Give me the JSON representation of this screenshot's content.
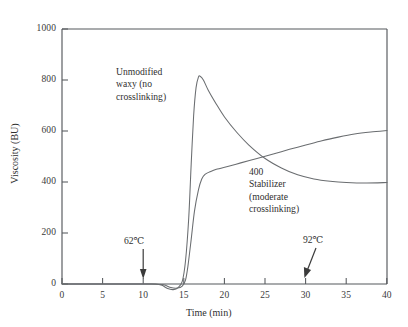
{
  "chart_data": {
    "type": "line",
    "title": "",
    "xlabel": "Time (min)",
    "ylabel": "Viscosity (BU)",
    "xlim": [
      0,
      40
    ],
    "ylim": [
      0,
      1000
    ],
    "xticks": [
      0,
      5,
      10,
      15,
      20,
      25,
      30,
      35,
      40
    ],
    "yticks": [
      0,
      200,
      400,
      600,
      800,
      1000
    ],
    "xtick_labels": [
      "0",
      "5",
      "10",
      "15",
      "20",
      "25",
      "30",
      "35",
      "40"
    ],
    "ytick_labels": [
      "0",
      "200",
      "400",
      "600",
      "800",
      "1000"
    ],
    "grid": false,
    "legend": "inline-annotations",
    "series": [
      {
        "name": "Unmodified waxy (no crosslinking)",
        "label_lines": [
          "Unmodified",
          "waxy (no",
          "crosslinking)"
        ],
        "points": [
          [
            0,
            0
          ],
          [
            2,
            0
          ],
          [
            4,
            0
          ],
          [
            6,
            0
          ],
          [
            8,
            0
          ],
          [
            10,
            0
          ],
          [
            11.5,
            0
          ],
          [
            12.3,
            -5
          ],
          [
            13.0,
            -18
          ],
          [
            13.7,
            -22
          ],
          [
            14.3,
            -14
          ],
          [
            14.8,
            10
          ],
          [
            15.2,
            90
          ],
          [
            15.6,
            260
          ],
          [
            15.9,
            470
          ],
          [
            16.2,
            660
          ],
          [
            16.5,
            770
          ],
          [
            16.8,
            812
          ],
          [
            17.0,
            815
          ],
          [
            17.4,
            800
          ],
          [
            18.0,
            760
          ],
          [
            19.0,
            705
          ],
          [
            20.0,
            655
          ],
          [
            21.5,
            595
          ],
          [
            23.0,
            545
          ],
          [
            25.0,
            492
          ],
          [
            27.0,
            455
          ],
          [
            29.0,
            428
          ],
          [
            31.0,
            412
          ],
          [
            33.0,
            403
          ],
          [
            35.0,
            398
          ],
          [
            37.5,
            396
          ],
          [
            40.0,
            398
          ]
        ]
      },
      {
        "name": "400 Stabilizer (moderate crosslinking)",
        "label_lines": [
          "400",
          "Stabilizer",
          "(moderate",
          "crosslinking)"
        ],
        "points": [
          [
            0,
            0
          ],
          [
            3,
            0
          ],
          [
            6,
            0
          ],
          [
            9,
            0
          ],
          [
            11,
            0
          ],
          [
            12.5,
            -3
          ],
          [
            13.4,
            -14
          ],
          [
            14.2,
            -16
          ],
          [
            14.8,
            -8
          ],
          [
            15.2,
            15
          ],
          [
            15.5,
            70
          ],
          [
            15.9,
            175
          ],
          [
            16.3,
            285
          ],
          [
            16.8,
            370
          ],
          [
            17.2,
            412
          ],
          [
            17.6,
            430
          ],
          [
            18.2,
            440
          ],
          [
            19.0,
            450
          ],
          [
            20.5,
            462
          ],
          [
            22.0,
            475
          ],
          [
            24.0,
            492
          ],
          [
            26.0,
            510
          ],
          [
            28.0,
            528
          ],
          [
            30.0,
            545
          ],
          [
            32.0,
            562
          ],
          [
            34.0,
            576
          ],
          [
            36.0,
            588
          ],
          [
            38.0,
            596
          ],
          [
            40.0,
            602
          ]
        ]
      }
    ],
    "annotations": [
      {
        "text": "62℃",
        "x": 10,
        "y": 0,
        "arrow": "down",
        "name": "temperature-annotation-62c"
      },
      {
        "text": "92℃",
        "x": 30,
        "y": 0,
        "arrow": "down-left",
        "name": "temperature-annotation-92c"
      }
    ],
    "colors": {
      "axis": "#55585c",
      "curve": "#6a6d70",
      "text": "#2f2f2f",
      "background": "#ffffff"
    }
  }
}
